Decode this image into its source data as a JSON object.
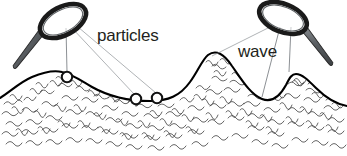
{
  "figure": {
    "width": 347,
    "height": 156,
    "background_color": "#ffffff"
  },
  "labels": [
    {
      "id": "particles",
      "text": "particles",
      "x": 97,
      "y": 41,
      "color": "#231f20",
      "font_size": 17
    },
    {
      "id": "wave",
      "text": "wave",
      "x": 238,
      "y": 57,
      "color": "#231f20",
      "font_size": 17
    }
  ],
  "magnifiers": [
    {
      "id": "left-magnifier",
      "label_ref": "particles",
      "lens_center_x": 63,
      "lens_center_y": 21,
      "lens_radius_x": 25,
      "lens_radius_y": 14,
      "lens_rotation_deg": -28,
      "handle_angle_deg": 208,
      "handle_length": 46,
      "rim_color": "#1a1a1a",
      "handle_color": "#5f6366"
    },
    {
      "id": "right-magnifier",
      "label_ref": "wave",
      "lens_center_x": 283,
      "lens_center_y": 18,
      "lens_radius_x": 25,
      "lens_radius_y": 14,
      "lens_rotation_deg": 22,
      "handle_angle_deg": 28,
      "handle_length": 46,
      "rim_color": "#1a1a1a",
      "handle_color": "#5f6366"
    }
  ],
  "particles": [
    {
      "id": "particle-1",
      "x": 67,
      "y": 77,
      "radius": 5.2
    },
    {
      "id": "particle-2",
      "x": 136,
      "y": 99,
      "radius": 5.2
    },
    {
      "id": "particle-3",
      "x": 157,
      "y": 98,
      "radius": 5.2
    }
  ],
  "leader_lines": [
    {
      "id": "leader-left-to-particle-1",
      "from_x": 66,
      "from_y": 28,
      "to_x": 67,
      "to_y": 72
    },
    {
      "id": "leader-left-to-particle-2",
      "from_x": 72,
      "from_y": 28,
      "to_x": 134,
      "to_y": 94
    },
    {
      "id": "leader-left-to-particle-3",
      "from_x": 78,
      "from_y": 27,
      "to_x": 156,
      "to_y": 93
    },
    {
      "id": "leader-right-to-crest",
      "from_x": 272,
      "from_y": 26,
      "to_x": 212,
      "to_y": 56
    },
    {
      "id": "leader-right-to-trough",
      "from_x": 280,
      "from_y": 27,
      "to_x": 262,
      "to_y": 97
    },
    {
      "id": "leader-right-to-crest-2",
      "from_x": 291,
      "from_y": 27,
      "to_x": 289,
      "to_y": 72
    }
  ],
  "wave": {
    "id": "wave-surface",
    "stroke_color": "#000000",
    "stroke_width": 2.1,
    "description": "Water surface profile with a low left crest, a broad trough, a tall right crest and a second smaller crest",
    "crests": [
      {
        "label": "left-crest",
        "x": 62,
        "y": 72
      },
      {
        "label": "main-crest",
        "x": 208,
        "y": 55
      },
      {
        "label": "right-crest",
        "x": 296,
        "y": 74
      }
    ],
    "troughs": [
      {
        "label": "main-trough",
        "x": 150,
        "y": 101
      },
      {
        "label": "right-trough",
        "x": 262,
        "y": 99
      }
    ]
  },
  "water_body": {
    "id": "water-texture",
    "fill_color": "#ffffff",
    "scribble_color": "#4a4a4a",
    "description": "Dense squiggle texture representing water molecules"
  }
}
